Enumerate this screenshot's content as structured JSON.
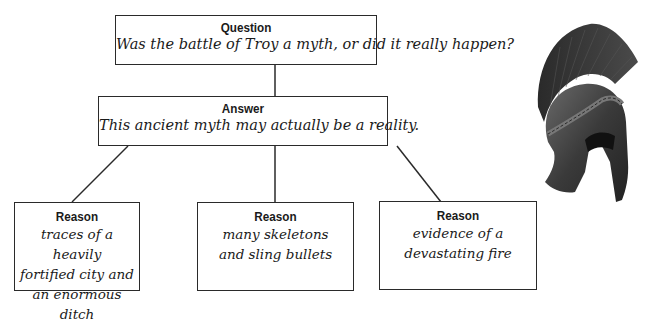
{
  "question": {
    "title": "Question",
    "text": "Was the battle of Troy a myth, or did it really happen?"
  },
  "answer": {
    "title": "Answer",
    "text": "This ancient myth may actually be a reality."
  },
  "reasons": [
    {
      "title": "Reason",
      "lines": [
        "traces of a heavily",
        "fortified city and",
        "an enormous ditch"
      ]
    },
    {
      "title": "Reason",
      "lines": [
        "many skeletons",
        "and sling bullets"
      ]
    },
    {
      "title": "Reason",
      "lines": [
        "evidence of a",
        "devastating fire"
      ]
    }
  ],
  "image": {
    "subject": "helmet-icon",
    "description": "Ancient Greek Corinthian helmet with crest"
  }
}
